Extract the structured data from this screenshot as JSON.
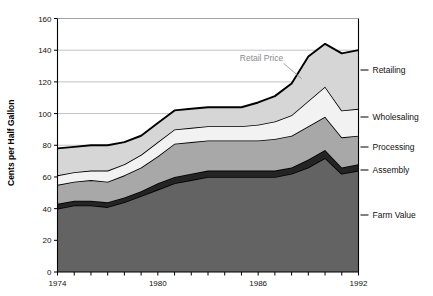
{
  "chart_data": {
    "type": "area",
    "title": "",
    "subtitle": "",
    "xlabel": "",
    "ylabel": "Cents per Half Gallon",
    "xlim": [
      1974,
      1992
    ],
    "ylim": [
      0,
      160
    ],
    "ytick_step": 20,
    "yticks": [
      0,
      20,
      40,
      60,
      80,
      100,
      120,
      140,
      160
    ],
    "xticks": [
      1974,
      1975,
      1976,
      1977,
      1978,
      1979,
      1980,
      1981,
      1982,
      1983,
      1984,
      1985,
      1986,
      1987,
      1988,
      1989,
      1990,
      1991,
      1992
    ],
    "xtick_labels": [
      "1974",
      "",
      "",
      "",
      "",
      "",
      "1980",
      "",
      "",
      "",
      "",
      "",
      "1986",
      "",
      "",
      "",
      "",
      "",
      "1992"
    ],
    "grid": "horizontal",
    "legend_position": "right-of-plot",
    "stacked": true,
    "stack_order_bottom_to_top": [
      "Farm Value",
      "Assembly",
      "Processing",
      "Wholesaling",
      "Retailing"
    ],
    "x": [
      1974,
      1975,
      1976,
      1977,
      1978,
      1979,
      1980,
      1981,
      1982,
      1983,
      1984,
      1985,
      1986,
      1987,
      1988,
      1989,
      1990,
      1991,
      1992
    ],
    "series": [
      {
        "name": "Farm Value",
        "color": "#636363",
        "values": [
          40,
          42,
          42,
          41,
          44,
          48,
          52,
          56,
          58,
          60,
          60,
          60,
          60,
          60,
          62,
          66,
          72,
          62,
          64
        ]
      },
      {
        "name": "Assembly",
        "color": "#242424",
        "values": [
          3,
          3,
          3,
          3,
          3,
          3,
          4,
          4,
          4,
          4,
          4,
          4,
          4,
          4,
          4,
          5,
          5,
          4,
          4
        ]
      },
      {
        "name": "Processing",
        "color": "#a8a8a8",
        "values": [
          12,
          12,
          13,
          13,
          14,
          15,
          17,
          21,
          20,
          19,
          19,
          19,
          19,
          20,
          20,
          21,
          21,
          19,
          18
        ]
      },
      {
        "name": "Wholesaling",
        "color": "#f2f2f2",
        "values": [
          6,
          6,
          6,
          7,
          7,
          8,
          9,
          9,
          9,
          9,
          9,
          9,
          10,
          11,
          13,
          16,
          19,
          17,
          17
        ]
      },
      {
        "name": "Retailing",
        "color": "#d6d6d6",
        "values": [
          17,
          16,
          16,
          16,
          14,
          12,
          12,
          12,
          12,
          12,
          12,
          12,
          14,
          16,
          20,
          28,
          27,
          36,
          37
        ]
      }
    ],
    "stack_tops": {
      "farm_value": [
        40,
        42,
        42,
        41,
        44,
        48,
        52,
        56,
        58,
        60,
        60,
        60,
        60,
        60,
        62,
        66,
        72,
        62,
        64
      ],
      "assembly": [
        43,
        45,
        45,
        44,
        47,
        51,
        56,
        60,
        62,
        64,
        64,
        64,
        64,
        64,
        66,
        71,
        77,
        66,
        68
      ],
      "processing": [
        55,
        57,
        58,
        57,
        61,
        66,
        73,
        81,
        82,
        83,
        83,
        83,
        83,
        84,
        86,
        92,
        98,
        85,
        86
      ],
      "wholesaling": [
        61,
        63,
        64,
        64,
        68,
        74,
        82,
        90,
        91,
        92,
        92,
        92,
        93,
        95,
        99,
        108,
        117,
        102,
        103
      ],
      "retail_price": [
        78,
        79,
        80,
        80,
        82,
        86,
        94,
        102,
        103,
        104,
        104,
        104,
        107,
        111,
        119,
        136,
        144,
        138,
        140
      ]
    },
    "annotations": [
      {
        "text": "Retail Price",
        "x_value": 1986.2,
        "y_value": 133,
        "leader_to_x": 1988.6,
        "leader_to_y": 122
      }
    ],
    "series_labels_right": [
      "Retailing",
      "Wholesaling",
      "Processing",
      "Assembly",
      "Farm Value"
    ]
  },
  "axis": {
    "ylabel": "Cents per Half Gallon",
    "ytick_labels": [
      "0",
      "20",
      "40",
      "60",
      "80",
      "100",
      "120",
      "140",
      "160"
    ],
    "xtick_labels_visible": [
      "1974",
      "1980",
      "1986",
      "1992"
    ]
  },
  "labels": {
    "retailing": "Retailing",
    "wholesaling": "Wholesaling",
    "processing": "Processing",
    "assembly": "Assembly",
    "farm_value": "Farm Value",
    "retail_price": "Retail Price"
  },
  "colors": {
    "farm_value": "#636363",
    "assembly": "#242424",
    "processing": "#a8a8a8",
    "wholesaling": "#f2f2f2",
    "retailing": "#d6d6d6",
    "outline": "#000000",
    "grid": "#9a9a9a",
    "axis": "#000000",
    "annotation": "#8a8a8a",
    "background": "#ffffff"
  }
}
